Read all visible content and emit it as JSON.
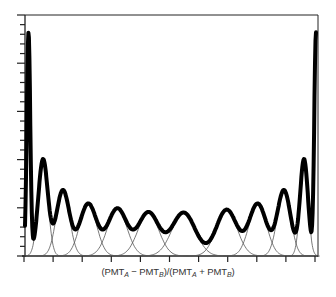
{
  "chart_data": {
    "type": "line",
    "title": "",
    "xlabel": "(PMT_A − PMT_B)/(PMT_A + PMT_B)",
    "ylabel": "",
    "x_tick_labels": [],
    "y_tick_labels": [],
    "grid": false,
    "legend": "none",
    "ylim": [
      0,
      25
    ],
    "xlim": [
      0,
      10
    ],
    "y_ticks": {
      "minor_count": 25,
      "major_every": 5
    },
    "x_ticks": {
      "count": 11
    },
    "series": [
      {
        "name": "histogram",
        "peaks": [
          {
            "x": 0.12,
            "height": 23.1,
            "label": "left-edge"
          },
          {
            "x": 0.62,
            "height": 10.0
          },
          {
            "x": 1.3,
            "height": 6.8
          },
          {
            "x": 2.17,
            "height": 5.4
          },
          {
            "x": 3.17,
            "height": 4.9
          },
          {
            "x": 4.24,
            "height": 4.5
          },
          {
            "x": 5.45,
            "height": 4.5
          },
          {
            "x": 6.93,
            "height": 4.8
          },
          {
            "x": 8.0,
            "height": 5.4
          },
          {
            "x": 8.9,
            "height": 6.8
          },
          {
            "x": 9.59,
            "height": 10.0
          },
          {
            "x": 10.0,
            "height": 23.1,
            "label": "right-edge"
          }
        ]
      }
    ]
  },
  "axis_label": {
    "pre": "(PMT",
    "sub_a": "A",
    "mid1": " − PMT",
    "sub_b": "B",
    "mid2": ")/(PMT",
    "sub_a2": "A",
    "mid3": " + PMT",
    "sub_b2": "B",
    "post": ")"
  }
}
